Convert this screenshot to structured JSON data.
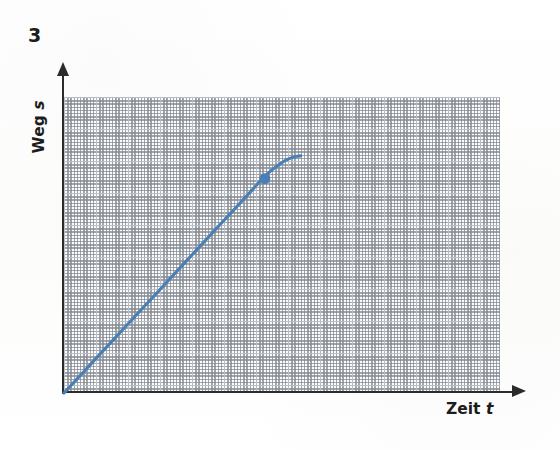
{
  "exercise": {
    "number": "3"
  },
  "axes": {
    "y_label_text": "Weg",
    "y_label_symbol": "s",
    "x_label_text": "Zeit",
    "x_label_symbol": "t"
  },
  "colors": {
    "curve": "#4a7fb5",
    "marker": "#4a7fb5",
    "axis": "#2b2b2b",
    "grid_major": "#b9bcc4",
    "grid_minor": "#c9ccd3",
    "background": "#fdfdfd"
  },
  "chart_data": {
    "type": "line",
    "title": "",
    "xlabel": "Zeit t",
    "ylabel": "Weg s",
    "grid": "graph-paper dotted minor with solid major lines, 2 minor per major",
    "legend": "none",
    "axis_style": "arrow-terminated, unlabeled ticks",
    "xlim": [
      0,
      14
    ],
    "ylim": [
      0,
      9.25
    ],
    "series": [
      {
        "name": "Weg-Zeit-Verlauf",
        "comment": "gleichmaessige Bewegung, dann Abbremsen bis Stillstand",
        "x": [
          0.0,
          1.0,
          2.0,
          3.0,
          4.0,
          5.0,
          6.0,
          6.5,
          7.0,
          7.25,
          7.5,
          7.6
        ],
        "y": [
          0.0,
          1.05,
          2.1,
          3.15,
          4.2,
          5.25,
          6.3,
          6.82,
          7.2,
          7.33,
          7.4,
          7.41
        ]
      }
    ],
    "markers": [
      {
        "name": "knickpunkt",
        "x": 6.45,
        "y": 6.7,
        "label": ""
      }
    ]
  }
}
